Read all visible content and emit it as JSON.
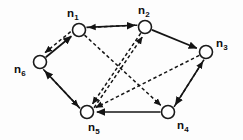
{
  "figure": {
    "type": "directed-graph-diagram",
    "width": 243,
    "height": 140,
    "background_color": "#fdfdfd",
    "ink_color": "#141414",
    "node_fill_color": "#ffffff"
  },
  "nodes": [
    {
      "id": "n1",
      "base": "n",
      "sub": "1",
      "label": "n1",
      "cx": 79,
      "cy": 30,
      "r": 6.5,
      "label_x": 67,
      "label_y": 8
    },
    {
      "id": "n2",
      "base": "n",
      "sub": "2",
      "label": "n2",
      "cx": 145,
      "cy": 27,
      "r": 6.5,
      "label_x": 138,
      "label_y": 5
    },
    {
      "id": "n3",
      "base": "n",
      "sub": "3",
      "label": "n3",
      "cx": 206,
      "cy": 52,
      "r": 6.5,
      "label_x": 216,
      "label_y": 38
    },
    {
      "id": "n4",
      "base": "n",
      "sub": "4",
      "label": "n4",
      "cx": 168,
      "cy": 112,
      "r": 6.5,
      "label_x": 177,
      "label_y": 120
    },
    {
      "id": "n5",
      "base": "n",
      "sub": "5",
      "label": "n5",
      "cx": 87,
      "cy": 112,
      "r": 6.5,
      "label_x": 88,
      "label_y": 122
    },
    {
      "id": "n6",
      "base": "n",
      "sub": "6",
      "label": "n6",
      "cx": 40,
      "cy": 62,
      "r": 6.5,
      "label_x": 14,
      "label_y": 64
    }
  ],
  "edges": [
    {
      "id": "e-n6-n1",
      "from": "n6",
      "to": "n1",
      "style": "solid",
      "directed": true,
      "offset": 0
    },
    {
      "id": "e-n1-n6",
      "from": "n1",
      "to": "n6",
      "style": "dashed",
      "directed": true,
      "offset": 4
    },
    {
      "id": "e-n1-n2",
      "from": "n1",
      "to": "n2",
      "style": "solid",
      "directed": true,
      "offset": -2.2
    },
    {
      "id": "e-n2-n1",
      "from": "n2",
      "to": "n1",
      "style": "dashed",
      "directed": true,
      "offset": 2.2
    },
    {
      "id": "e-n2-n3",
      "from": "n2",
      "to": "n3",
      "style": "solid",
      "directed": true,
      "offset": 0
    },
    {
      "id": "e-n3-n4",
      "from": "n3",
      "to": "n4",
      "style": "solid",
      "directed": true,
      "offset": -2.4
    },
    {
      "id": "e-n4-n3",
      "from": "n4",
      "to": "n3",
      "style": "dashed",
      "directed": true,
      "offset": 2.4
    },
    {
      "id": "e-n4-n5",
      "from": "n4",
      "to": "n5",
      "style": "solid",
      "directed": true,
      "offset": 0
    },
    {
      "id": "e-n5-n6",
      "from": "n5",
      "to": "n6",
      "style": "solid",
      "directed": true,
      "offset": -2.6
    },
    {
      "id": "e-n6-n5",
      "from": "n6",
      "to": "n5",
      "style": "dashed",
      "directed": true,
      "offset": 2.6
    },
    {
      "id": "e-n1-n4",
      "from": "n1",
      "to": "n4",
      "style": "dashed",
      "directed": true,
      "offset": 0
    },
    {
      "id": "e-n2-n5",
      "from": "n2",
      "to": "n5",
      "style": "dashed",
      "directed": true,
      "offset": 0
    },
    {
      "id": "e-n5-n2",
      "from": "n5",
      "to": "n2",
      "style": "dashed",
      "directed": true,
      "offset": 3.4
    },
    {
      "id": "e-n3-n5",
      "from": "n3",
      "to": "n5",
      "style": "dashed",
      "directed": true,
      "offset": 0
    }
  ]
}
